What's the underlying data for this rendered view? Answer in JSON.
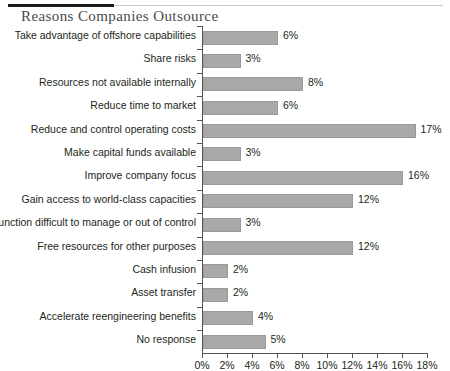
{
  "header": {
    "rule_dark_color": "#1a1a1a",
    "rule_light_color": "#c9c9c9"
  },
  "chart_data": {
    "type": "bar",
    "orientation": "horizontal",
    "title": "Reasons Companies Outsource",
    "xlabel": "",
    "ylabel": "",
    "xlim": [
      0,
      18
    ],
    "xtick_step": 2,
    "grid": false,
    "legend": null,
    "bar_color": "#a9a9a9",
    "bar_border_color": "#9a9a9a",
    "axis_color": "#555555",
    "value_suffix": "%",
    "xticks": [
      "0%",
      "2%",
      "4%",
      "6%",
      "8%",
      "10%",
      "12%",
      "14%",
      "16%",
      "18%"
    ],
    "categories": [
      "Take advantage of offshore capabilities",
      "Share risks",
      "Resources not available internally",
      "Reduce time to market",
      "Reduce and control operating costs",
      "Make capital funds available",
      "Improve company focus",
      "Gain access to world-class capacities",
      "Function difficult to manage or out of control",
      "Free resources for other purposes",
      "Cash infusion",
      "Asset transfer",
      "Accelerate reengineering benefits",
      "No response"
    ],
    "values": [
      6,
      3,
      8,
      6,
      17,
      3,
      16,
      12,
      3,
      12,
      2,
      2,
      4,
      5
    ],
    "value_labels": [
      "6%",
      "3%",
      "8%",
      "6%",
      "17%",
      "3%",
      "16%",
      "12%",
      "3%",
      "12%",
      "2%",
      "2%",
      "4%",
      "5%"
    ]
  }
}
